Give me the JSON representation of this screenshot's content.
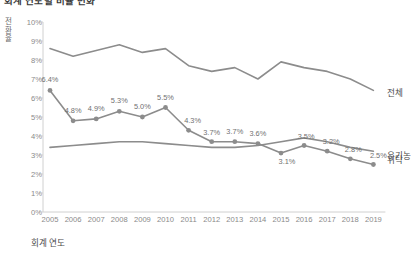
{
  "title": "회계 연도별 비율 변화",
  "axis": {
    "y_label": "전환율",
    "x_label": "회계 연도",
    "y_ticks": [
      "0%",
      "1%",
      "2%",
      "3%",
      "4%",
      "5%",
      "6%",
      "7%",
      "8%",
      "9%",
      "10%"
    ],
    "x_ticks": [
      "2005",
      "2006",
      "2007",
      "2008",
      "2009",
      "2010",
      "2011",
      "2012",
      "2013",
      "2014",
      "2015",
      "2016",
      "2017",
      "2018",
      "2019"
    ]
  },
  "series_labels": {
    "total": "전체",
    "organic": "유기농",
    "consign": "위탁"
  },
  "colors": {
    "line": "#8c8c8c",
    "marker": "#8c8c8c",
    "axis": "#d0d0d0",
    "tick_text": "#8a8a8a",
    "label_text": "#6f6f6f"
  },
  "chart_data": {
    "type": "line",
    "title": "회계 연도별 비율 변화",
    "xlabel": "회계 연도",
    "ylabel": "전환율",
    "ylim": [
      0,
      10
    ],
    "yunit": "%",
    "grid": false,
    "legend": "right-inline",
    "categories": [
      "2005",
      "2006",
      "2007",
      "2008",
      "2009",
      "2010",
      "2011",
      "2012",
      "2013",
      "2014",
      "2015",
      "2016",
      "2017",
      "2018",
      "2019"
    ],
    "series": [
      {
        "name": "전체",
        "values": [
          8.6,
          8.2,
          8.5,
          8.8,
          8.4,
          8.6,
          7.7,
          7.4,
          7.6,
          7.0,
          7.9,
          7.6,
          7.4,
          7.0,
          6.4
        ],
        "markers": false,
        "labels": []
      },
      {
        "name": "유기농",
        "values": [
          6.4,
          4.8,
          4.9,
          5.3,
          5.0,
          5.5,
          4.3,
          3.7,
          3.7,
          3.6,
          3.1,
          3.5,
          3.2,
          2.8,
          2.5
        ],
        "markers": true,
        "labels": [
          "6.4%",
          "4.8%",
          "4.9%",
          "5.3%",
          "5.0%",
          "5.5%",
          "4.3%",
          "3.7%",
          "3.7%",
          "3.6%",
          "3.1%",
          "3.5%",
          "3.2%",
          "2.8%",
          "2.5%"
        ]
      },
      {
        "name": "위탁",
        "values": [
          3.4,
          3.5,
          3.6,
          3.7,
          3.7,
          3.6,
          3.5,
          3.4,
          3.4,
          3.5,
          3.7,
          3.9,
          3.7,
          3.4,
          3.2
        ],
        "markers": false,
        "labels": []
      }
    ]
  }
}
